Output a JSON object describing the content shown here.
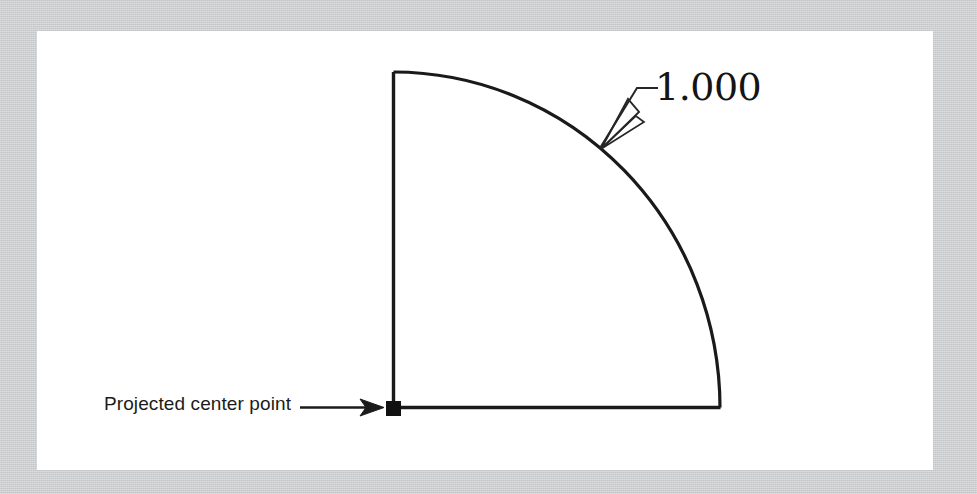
{
  "figure": {
    "background_color": "#c9cacb",
    "canvas_color": "#ffffff",
    "line_color": "#1a1a1a"
  },
  "annotations": {
    "center_point_label": "Projected center point",
    "dimension_value": "1.000"
  },
  "geometry": {
    "center_point": {
      "x": 393,
      "y": 408
    },
    "arc_start": {
      "x": 393,
      "y": 72
    },
    "arc_end": {
      "x": 720,
      "y": 408
    },
    "radius_x": 327,
    "radius_y": 336,
    "leader_tip": {
      "x": 600,
      "y": 148
    },
    "leader_elbow": {
      "x": 637,
      "y": 88
    },
    "leader_landing_end": {
      "x": 658,
      "y": 88
    },
    "label_arrow_start": {
      "x": 300,
      "y": 408
    },
    "label_arrow_end": {
      "x": 384,
      "y": 408
    }
  }
}
